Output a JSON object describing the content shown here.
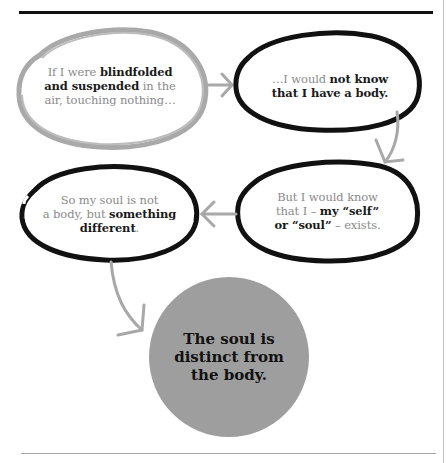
{
  "diagram": {
    "type": "argument-flow",
    "colors": {
      "premise_outline_gray": "#a9a9a9",
      "outline_black": "#111111",
      "arrow_gray": "#a8a8a8",
      "conclusion_fill": "#9e9e9e",
      "muted_text": "#8a8a8a",
      "bold_text": "#1a1a1a"
    },
    "nodes": [
      {
        "id": "premise-1",
        "outline": "gray",
        "segments": [
          {
            "text": "If I were ",
            "bold": false
          },
          {
            "text": "blindfolded",
            "bold": true
          },
          {
            "text": "and suspended",
            "bold": true
          },
          {
            "text": " in the",
            "bold": false
          },
          {
            "text": "air, touching nothing…",
            "bold": false
          }
        ]
      },
      {
        "id": "premise-2",
        "outline": "black",
        "segments": [
          {
            "text": "…I would ",
            "bold": false
          },
          {
            "text": "not know",
            "bold": true
          },
          {
            "text": "that I have a body.",
            "bold": true
          }
        ]
      },
      {
        "id": "premise-3",
        "outline": "black",
        "segments": [
          {
            "text": "But I would know",
            "bold": false
          },
          {
            "text": "that I – ",
            "bold": false
          },
          {
            "text": "my “self”",
            "bold": true
          },
          {
            "text": "or “soul”",
            "bold": true
          },
          {
            "text": " – exists.",
            "bold": false
          }
        ]
      },
      {
        "id": "premise-4",
        "outline": "black",
        "segments": [
          {
            "text": "So my soul is not",
            "bold": false
          },
          {
            "text": "a body, but ",
            "bold": false
          },
          {
            "text": "something",
            "bold": true
          },
          {
            "text": "different",
            "bold": true
          },
          {
            "text": ".",
            "bold": false
          }
        ]
      },
      {
        "id": "conclusion",
        "outline": "filled-gray-circle",
        "lines": [
          "The soul is",
          "distinct from",
          "the body."
        ]
      }
    ],
    "edges": [
      {
        "from": "premise-1",
        "to": "premise-2",
        "direction": "right"
      },
      {
        "from": "premise-2",
        "to": "premise-3",
        "direction": "down-curved"
      },
      {
        "from": "premise-3",
        "to": "premise-4",
        "direction": "left"
      },
      {
        "from": "premise-4",
        "to": "conclusion",
        "direction": "down-curved"
      }
    ]
  }
}
